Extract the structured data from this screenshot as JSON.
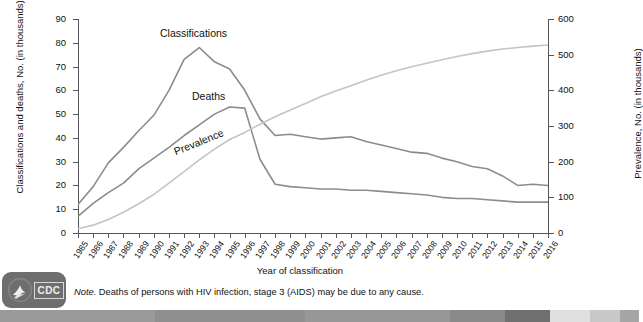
{
  "chart_data": {
    "type": "line",
    "title": "",
    "xlabel": "Year of classification",
    "ylabel": "Classifications and deaths, No. (in thousands)",
    "ylabel_right": "Prevalence, No. (in thousands)",
    "grid": false,
    "legend_position": "inline-annotations",
    "ylim": [
      0,
      90
    ],
    "ylim_right": [
      0,
      600
    ],
    "yticks": [
      0,
      10,
      20,
      30,
      40,
      50,
      60,
      70,
      80,
      90
    ],
    "yticks_right": [
      0,
      100,
      200,
      300,
      400,
      500,
      600
    ],
    "x": [
      1985,
      1986,
      1987,
      1988,
      1989,
      1990,
      1991,
      1992,
      1993,
      1994,
      1995,
      1996,
      1997,
      1998,
      1999,
      2000,
      2001,
      2002,
      2003,
      2004,
      2005,
      2006,
      2007,
      2008,
      2009,
      2010,
      2011,
      2012,
      2013,
      2014,
      2015,
      2016
    ],
    "xtick_labels": [
      "1985",
      "1986",
      "1987",
      "1988",
      "1989",
      "1990",
      "1991",
      "1992",
      "1993",
      "1994",
      "1995",
      "1996",
      "1997",
      "1998",
      "1999",
      "2000",
      "2001",
      "2002",
      "2003",
      "2004",
      "2005",
      "2006",
      "2007",
      "2008",
      "2009",
      "2010",
      "2011",
      "2012",
      "2013",
      "2014",
      "2015",
      "2016"
    ],
    "series": [
      {
        "name": "Classifications",
        "axis": "left",
        "color": "#8c8c8c",
        "units": "thousands",
        "values": [
          12.0,
          19.5,
          29.5,
          36.0,
          43.0,
          49.5,
          60.0,
          73.0,
          78.0,
          72.0,
          69.0,
          60.0,
          48.0,
          41.0,
          41.5,
          40.5,
          39.5,
          40.0,
          40.5,
          38.5,
          37.0,
          35.5,
          34.0,
          33.5,
          31.5,
          30.0,
          28.0,
          27.0,
          24.0,
          20.0,
          20.5,
          20.0
        ]
      },
      {
        "name": "Deaths",
        "axis": "left",
        "color": "#8c8c8c",
        "units": "thousands",
        "values": [
          7.0,
          12.5,
          17.0,
          21.0,
          27.0,
          31.5,
          36.0,
          41.0,
          45.5,
          50.0,
          53.0,
          52.5,
          31.0,
          20.5,
          19.5,
          19.0,
          18.5,
          18.5,
          18.0,
          18.0,
          17.5,
          17.0,
          16.5,
          16.0,
          15.0,
          14.5,
          14.5,
          14.0,
          13.5,
          13.0,
          13.0,
          13.0
        ]
      },
      {
        "name": "Prevalence",
        "axis": "right",
        "color": "#c4c4c4",
        "units": "thousands",
        "values": [
          12,
          22,
          38,
          58,
          82,
          108,
          140,
          172,
          205,
          235,
          262,
          282,
          305,
          326,
          345,
          363,
          382,
          398,
          413,
          428,
          442,
          455,
          466,
          476,
          486,
          495,
          503,
          510,
          516,
          520,
          524,
          527
        ]
      }
    ],
    "annotations": [
      {
        "text": "Classifications",
        "series": "Classifications"
      },
      {
        "text": "Deaths",
        "series": "Deaths"
      },
      {
        "text": "Prevalence",
        "series": "Prevalence"
      }
    ]
  },
  "footer": {
    "note_prefix": "Note.",
    "note_text": " Deaths of persons with HIV infection, stage 3 (AIDS) may be due to any cause.",
    "logo_label": "CDC"
  },
  "banner": {
    "segments": [
      {
        "color": "#9a9a9a",
        "width": 155
      },
      {
        "color": "#8f8f8f",
        "width": 150
      },
      {
        "color": "#979797",
        "width": 145
      },
      {
        "color": "#8a8a8a",
        "width": 55
      },
      {
        "color": "#707070",
        "width": 45
      },
      {
        "color": "#e0e0e0",
        "width": 40
      },
      {
        "color": "#c8c8c8",
        "width": 30
      },
      {
        "color": "#a6a6a6",
        "width": 19
      }
    ]
  }
}
